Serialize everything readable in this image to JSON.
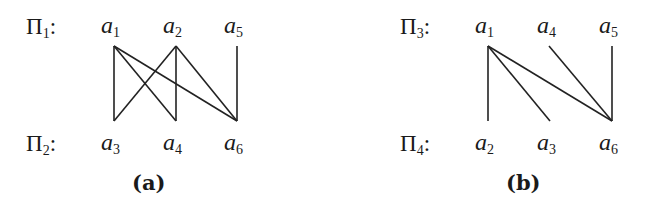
{
  "diagrams": [
    {
      "caption": "(a)",
      "top_partition": {
        "symbol": "Π",
        "index": "1",
        "colon": ":"
      },
      "bottom_partition": {
        "symbol": "Π",
        "index": "2",
        "colon": ":"
      },
      "top_nodes": [
        {
          "name": "a",
          "index": "1",
          "x": 114
        },
        {
          "name": "a",
          "index": "2",
          "x": 176
        },
        {
          "name": "a",
          "index": "5",
          "x": 237
        }
      ],
      "bottom_nodes": [
        {
          "name": "a",
          "index": "3",
          "x": 114
        },
        {
          "name": "a",
          "index": "4",
          "x": 176
        },
        {
          "name": "a",
          "index": "6",
          "x": 237
        }
      ],
      "edges": [
        [
          "a1",
          "a3"
        ],
        [
          "a1",
          "a4"
        ],
        [
          "a1",
          "a6"
        ],
        [
          "a2",
          "a3"
        ],
        [
          "a2",
          "a4"
        ],
        [
          "a2",
          "a6"
        ],
        [
          "a5",
          "a6"
        ]
      ]
    },
    {
      "caption": "(b)",
      "top_partition": {
        "symbol": "Π",
        "index": "3",
        "colon": ":"
      },
      "bottom_partition": {
        "symbol": "Π",
        "index": "4",
        "colon": ":"
      },
      "top_nodes": [
        {
          "name": "a",
          "index": "1",
          "x": 488
        },
        {
          "name": "a",
          "index": "4",
          "x": 550
        },
        {
          "name": "a",
          "index": "5",
          "x": 612
        }
      ],
      "bottom_nodes": [
        {
          "name": "a",
          "index": "2",
          "x": 488
        },
        {
          "name": "a",
          "index": "3",
          "x": 550
        },
        {
          "name": "a",
          "index": "6",
          "x": 612
        }
      ],
      "edges": [
        [
          "a1",
          "a2"
        ],
        [
          "a1",
          "a3"
        ],
        [
          "a1",
          "a6"
        ],
        [
          "a4",
          "a6"
        ],
        [
          "a5",
          "a6"
        ]
      ]
    }
  ]
}
